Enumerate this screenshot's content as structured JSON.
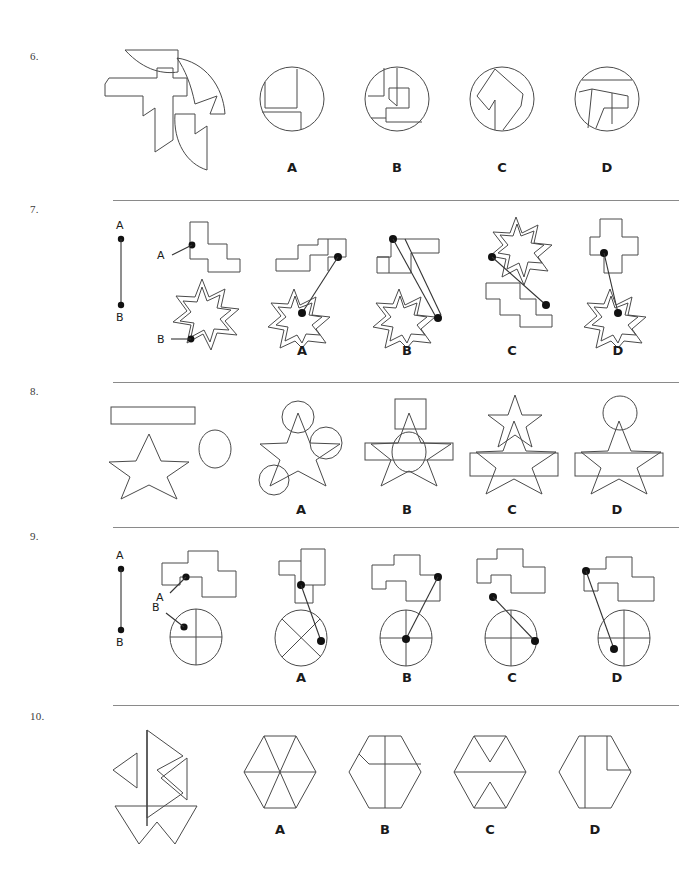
{
  "page": {
    "width": 689,
    "height": 876,
    "background": "#ffffff",
    "line_color": "#4a4a4a",
    "text_color": "#231f20"
  },
  "questions": [
    {
      "number": "6.",
      "type": "shape-assembly",
      "divider_above": false,
      "options": [
        "A",
        "B",
        "C",
        "D"
      ],
      "stimulus_description": "Four irregular polygon pieces: curved-top wedge, crescent arc, T-shaped arrow polygon, and a curved hook piece",
      "option_description": "Circles containing assembled line segments"
    },
    {
      "number": "7.",
      "type": "point-connection",
      "divider_above": true,
      "options": [
        "A",
        "B",
        "C",
        "D"
      ],
      "labels": {
        "a": "A",
        "b": "B"
      },
      "stimulus_description": "Vertical line segment from point A to point B; a stepped zigzag polygon with point A marked, and a 7-pointed star with point B marked"
    },
    {
      "number": "8.",
      "type": "shape-overlay",
      "divider_above": true,
      "options": [
        "A",
        "B",
        "C",
        "D"
      ],
      "stimulus_description": "A long thin rectangle, a five-pointed star, and a circle"
    },
    {
      "number": "9.",
      "type": "point-connection",
      "divider_above": true,
      "options": [
        "A",
        "B",
        "C",
        "D"
      ],
      "labels": {
        "a": "A",
        "b": "B"
      },
      "stimulus_description": "Vertical line segment from point A to point B; a stepped block polygon with point A marked, and a circle with crosshairs with point B marked"
    },
    {
      "number": "10.",
      "type": "shape-assembly",
      "divider_above": true,
      "options": [
        "A",
        "B",
        "C",
        "D"
      ],
      "stimulus_description": "Arrow-like triangular pieces and a zigzag trapezoid piece",
      "option_description": "Hexagons containing assembled line segments"
    }
  ],
  "option_labels": {
    "a": "A",
    "b": "B",
    "c": "C",
    "d": "D"
  }
}
